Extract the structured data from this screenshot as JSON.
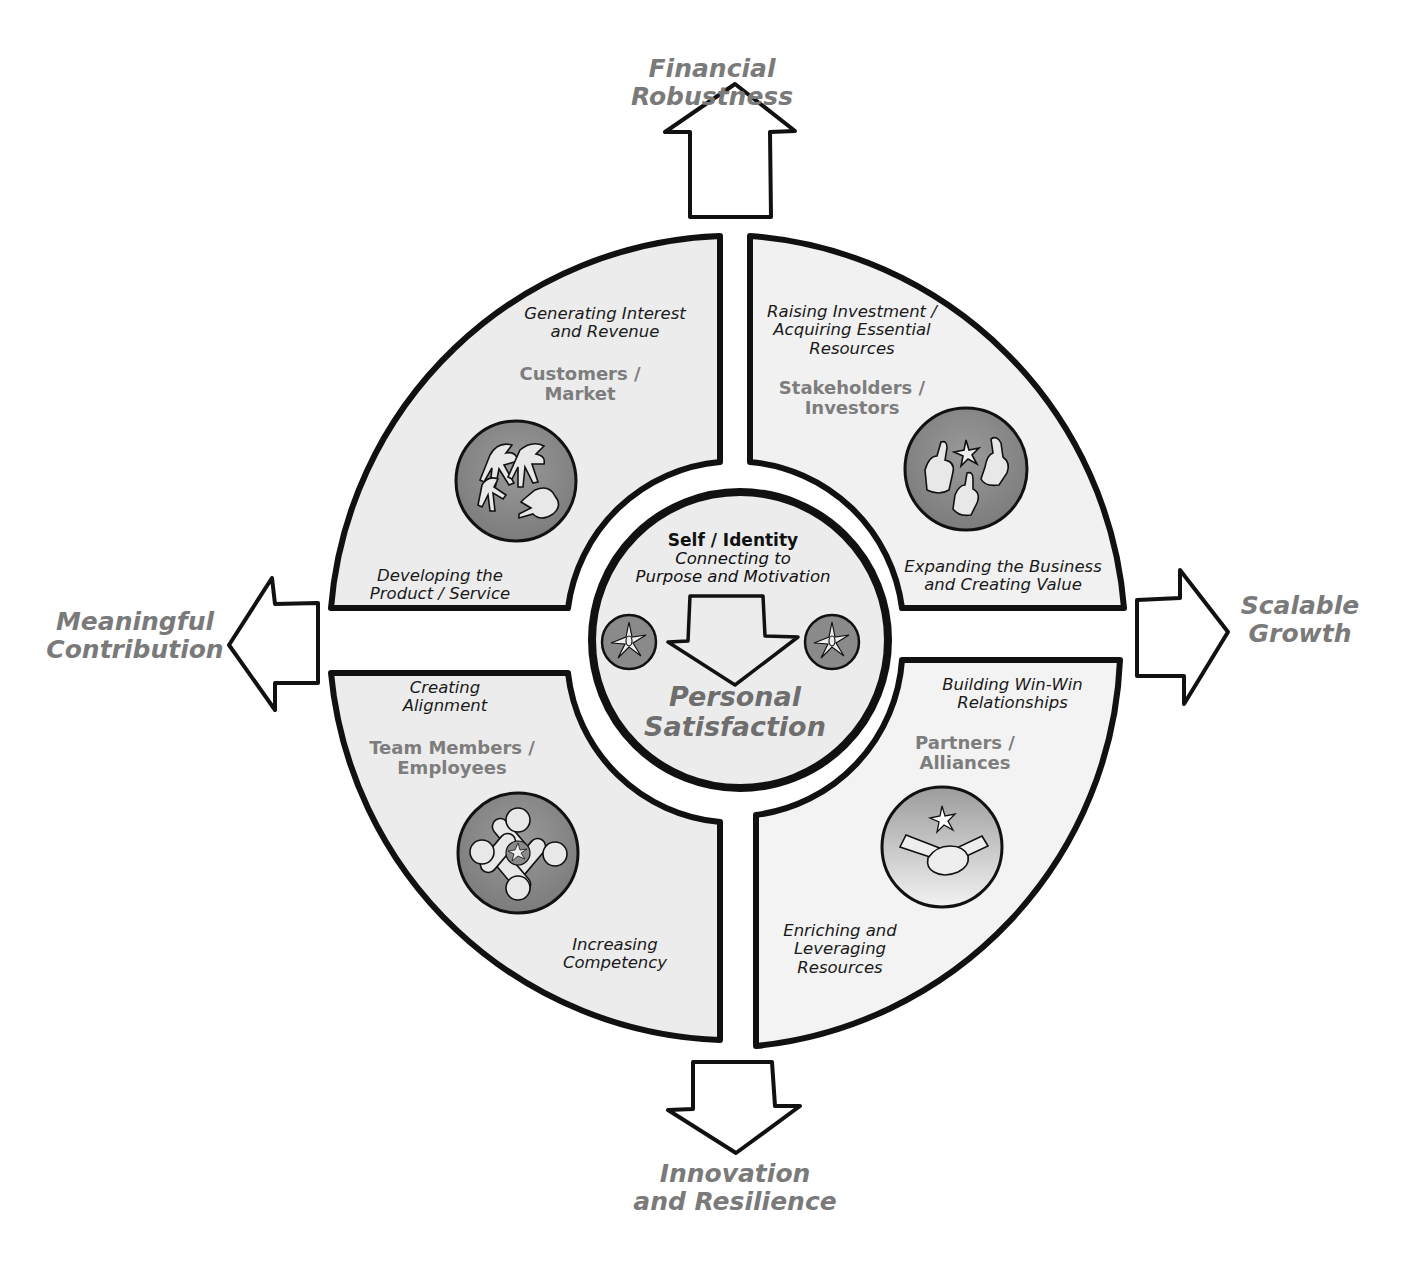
{
  "outcomes": {
    "top": {
      "line1": "Financial",
      "line2": "Robustness"
    },
    "right": {
      "line1": "Scalable",
      "line2": "Growth"
    },
    "bottom": {
      "line1": "Innovation",
      "line2": "and Resilience"
    },
    "left": {
      "line1": "Meaningful",
      "line2": "Contribution"
    }
  },
  "quadrants": {
    "top_left": {
      "stakeholder": {
        "line1": "Customers /",
        "line2": "Market"
      },
      "activity_top": {
        "line1": "Generating Interest",
        "line2": "and Revenue"
      },
      "activity_bottom": {
        "line1": "Developing the",
        "line2": "Product / Service"
      },
      "icon": "reaching-hands-icon"
    },
    "top_right": {
      "stakeholder": {
        "line1": "Stakeholders /",
        "line2": "Investors"
      },
      "activity_top": {
        "line1": "Raising Investment /",
        "line2": "Acquiring Essential",
        "line3": "Resources"
      },
      "activity_bottom": {
        "line1": "Expanding the Business",
        "line2": "and Creating Value"
      },
      "icon": "thumbs-up-icon"
    },
    "bottom_left": {
      "stakeholder": {
        "line1": "Team Members /",
        "line2": "Employees"
      },
      "activity_top": {
        "line1": "Creating",
        "line2": "Alignment"
      },
      "activity_bottom": {
        "line1": "Increasing",
        "line2": "Competency"
      },
      "icon": "linked-hands-icon"
    },
    "bottom_right": {
      "stakeholder": {
        "line1": "Partners /",
        "line2": "Alliances"
      },
      "activity_top": {
        "line1": "Building Win-Win",
        "line2": "Relationships"
      },
      "activity_bottom": {
        "line1": "Enriching and",
        "line2": "Leveraging",
        "line3": "Resources"
      },
      "icon": "handshake-icon"
    }
  },
  "center": {
    "title": "Self / Identity",
    "sub1": "Connecting to",
    "sub2": "Purpose and Motivation",
    "big1": "Personal",
    "big2": "Satisfaction",
    "icon": "spark-icon"
  },
  "colors": {
    "panel_fill": "#ececec",
    "outline": "#111111",
    "badge_dark": "#8a8a8a",
    "outcome_text": "#7a7a7a"
  }
}
